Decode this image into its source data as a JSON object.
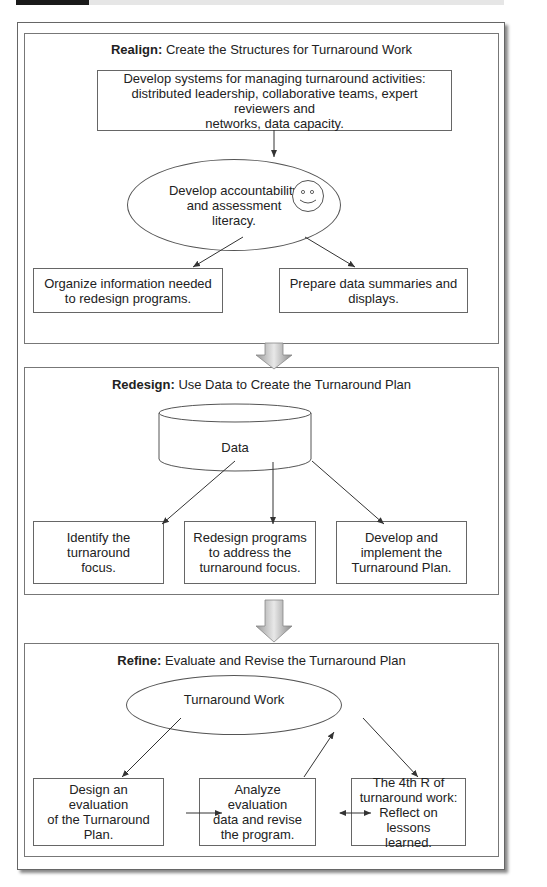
{
  "diagram": {
    "sections": [
      {
        "label": "Realign:",
        "title": "Create the Structures for Turnaround Work",
        "top_box": "Develop systems for managing turnaround activities:\ndistributed leadership, collaborative teams, expert reviewers and\nnetworks, data capacity.",
        "ellipse": "Develop accountability\nand assessment\nliteracy.",
        "ellipse_icon": "smiley-face-icon",
        "boxes": [
          "Organize information needed\nto redesign programs.",
          "Prepare data summaries and\ndisplays."
        ]
      },
      {
        "label": "Redesign:",
        "title": "Use Data to Create the Turnaround Plan",
        "cylinder": "Data",
        "boxes": [
          "Identify the turnaround\nfocus.",
          "Redesign programs\nto address the\nturnaround focus.",
          "Develop and\nimplement the\nTurnaround Plan."
        ]
      },
      {
        "label": "Refine:",
        "title": "Evaluate and Revise the Turnaround Plan",
        "ellipse": "Turnaround Work",
        "boxes": [
          "Design an evaluation\nof the Turnaround\nPlan.",
          "Analyze evaluation\ndata and revise\nthe program.",
          "The 4th R of\nturnaround work:\nReflect on lessons\nlearned."
        ]
      }
    ],
    "connectors": {
      "between_sections": "down-block-arrow-icon"
    }
  }
}
